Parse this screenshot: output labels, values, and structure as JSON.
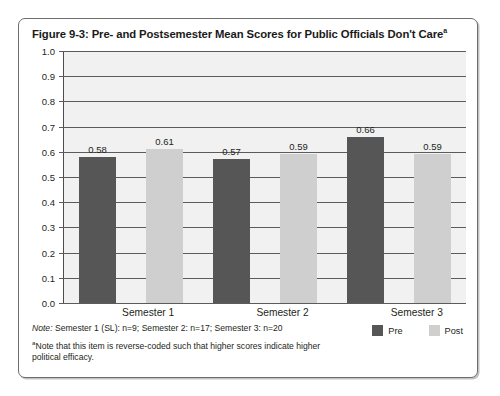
{
  "figure": {
    "title_main": "Figure 9-3: Pre- and Postsemester Mean Scores for Public Officials Don't Care",
    "title_superscript": "a"
  },
  "chart_data": {
    "type": "bar",
    "title": "Figure 9-3: Pre- and Postsemester Mean Scores for Public Officials Don't Care",
    "xlabel": "",
    "ylabel": "",
    "ylim": [
      0.0,
      1.0
    ],
    "grid": true,
    "legend_position": "bottom-right",
    "categories": [
      "Semester 1",
      "Semester 2",
      "Semester 3"
    ],
    "series": [
      {
        "name": "Pre",
        "color": "#565656",
        "values": [
          0.58,
          0.57,
          0.66
        ]
      },
      {
        "name": "Post",
        "color": "#cfcfcf",
        "values": [
          0.61,
          0.59,
          0.59
        ]
      }
    ],
    "y_ticks": [
      "1.0",
      "0.9",
      "0.8",
      "0.7",
      "0.6",
      "0.5",
      "0.4",
      "0.3",
      "0.2",
      "0.1",
      "0.0"
    ],
    "y_tick_values": [
      1.0,
      0.9,
      0.8,
      0.7,
      0.6,
      0.5,
      0.4,
      0.3,
      0.2,
      0.1,
      0.0
    ],
    "bar_labels": [
      "0.58",
      "0.61",
      "0.57",
      "0.59",
      "0.66",
      "0.59"
    ]
  },
  "legend": {
    "items": [
      {
        "label": "Pre",
        "color": "#565656"
      },
      {
        "label": "Post",
        "color": "#cfcfcf"
      }
    ]
  },
  "footer": {
    "note_prefix": "Note:",
    "note_text": " Semester 1 (SL): n=9; Semester 2: n=17; Semester 3: n=20",
    "footnote_marker": "a",
    "footnote_text": "Note that this item is reverse-coded such that higher scores indicate higher political efficacy."
  }
}
